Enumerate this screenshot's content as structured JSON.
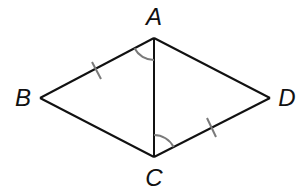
{
  "diagram": {
    "type": "quadrilateral-with-diagonal",
    "vertices": {
      "A": {
        "label": "A",
        "x": 154,
        "y": 38,
        "label_x": 154,
        "label_y": 17
      },
      "B": {
        "label": "B",
        "x": 40,
        "y": 98,
        "label_x": 23,
        "label_y": 98
      },
      "C": {
        "label": "C",
        "x": 154,
        "y": 157,
        "label_x": 154,
        "label_y": 178
      },
      "D": {
        "label": "D",
        "x": 270,
        "y": 98,
        "label_x": 287,
        "label_y": 98
      }
    },
    "segments": [
      "AB",
      "BC",
      "CD",
      "DA",
      "AC"
    ],
    "congruence_marks": [
      {
        "segment": "AB",
        "ticks": 1
      },
      {
        "segment": "CD",
        "ticks": 1
      }
    ],
    "angle_marks": [
      {
        "vertex": "A",
        "between": [
          "AB",
          "AC"
        ],
        "arcs": 1
      },
      {
        "vertex": "C",
        "between": [
          "CA",
          "CD"
        ],
        "arcs": 1
      }
    ],
    "colors": {
      "line": "#111111",
      "mark": "#7a7a7a",
      "label": "#111111"
    }
  }
}
